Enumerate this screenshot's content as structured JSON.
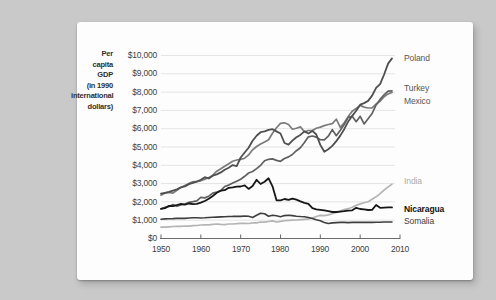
{
  "page": {
    "background": "#c9c9c9",
    "card_background": "#fdfdfd"
  },
  "axis_title_lines": [
    "Per",
    "capita",
    "GDP",
    "(in 1990",
    "international",
    "dollars)"
  ],
  "chart_data": {
    "type": "line",
    "title": "Per capita GDP (in 1990 international dollars)",
    "ylabel": "Per capita GDP (in 1990 international dollars)",
    "xlabel": "",
    "x_range": [
      1950,
      2010
    ],
    "y_range": [
      0,
      10000
    ],
    "grid": "horizontal",
    "grid_color": "#e4e4e4",
    "axis_color": "#6b6b6b",
    "y_ticks": [
      "$10,000",
      "$9,000",
      "$8,000",
      "$7,000",
      "$6,000",
      "$5,000",
      "$4,000",
      "$3,000",
      "$2,000",
      "$1,000",
      "$0"
    ],
    "x_ticks": [
      "1950",
      "1960",
      "1970",
      "1980",
      "1990",
      "2000",
      "2010"
    ],
    "years_start": 1950,
    "years_end": 2008,
    "legend_position": "right-of-line-endpoints",
    "series": [
      {
        "name": "Poland",
        "color": "#4f4f4f",
        "width": 1.8,
        "z": 3,
        "label_color": "#555555",
        "label_bold": false,
        "values": [
          2447,
          2496,
          2545,
          2618,
          2683,
          2790,
          2846,
          2970,
          3045,
          3105,
          3215,
          3350,
          3280,
          3430,
          3500,
          3612,
          3760,
          3870,
          4010,
          3950,
          4428,
          4700,
          4963,
          5340,
          5620,
          5810,
          5850,
          5942,
          5975,
          5850,
          5740,
          5220,
          5130,
          5350,
          5530,
          5660,
          5850,
          5740,
          5880,
          5684,
          5113,
          4738,
          4880,
          5060,
          5320,
          5623,
          5970,
          6390,
          6700,
          6980,
          7309,
          7400,
          7520,
          7810,
          8230,
          8436,
          8960,
          9560,
          9840
        ]
      },
      {
        "name": "Turkey",
        "color": "#606060",
        "width": 1.7,
        "z": 2,
        "label_color": "#555555",
        "label_bold": false,
        "values": [
          1623,
          1700,
          1750,
          1850,
          1760,
          1830,
          1880,
          1970,
          2010,
          2060,
          2247,
          2220,
          2310,
          2480,
          2540,
          2620,
          2840,
          2920,
          3030,
          3130,
          3240,
          3400,
          3580,
          3660,
          3820,
          4000,
          4250,
          4330,
          4350,
          4270,
          4220,
          4370,
          4460,
          4590,
          4800,
          4960,
          5240,
          5560,
          5600,
          5540,
          5400,
          5390,
          5590,
          5950,
          5620,
          5920,
          6230,
          6620,
          6680,
          6380,
          6680,
          6260,
          6540,
          6830,
          7300,
          7600,
          7850,
          8050,
          8066
        ]
      },
      {
        "name": "Mexico",
        "color": "#7b7b7b",
        "width": 1.7,
        "z": 1,
        "label_color": "#555555",
        "label_bold": false,
        "values": [
          2365,
          2480,
          2520,
          2480,
          2640,
          2790,
          2900,
          3010,
          3100,
          3120,
          3155,
          3245,
          3330,
          3465,
          3680,
          3810,
          3950,
          4080,
          4220,
          4290,
          4320,
          4390,
          4570,
          4845,
          5030,
          5160,
          5270,
          5400,
          5750,
          6050,
          6290,
          6320,
          6230,
          5970,
          6030,
          6100,
          5830,
          5900,
          5899,
          6030,
          6085,
          6170,
          6231,
          6280,
          6519,
          6072,
          6330,
          6660,
          6950,
          7110,
          7275,
          7180,
          7130,
          7137,
          7350,
          7500,
          7750,
          7900,
          7979
        ]
      },
      {
        "name": "India",
        "color": "#b4b4b4",
        "width": 1.7,
        "z": 4,
        "label_color": "#ababab",
        "label_bold": false,
        "values": [
          619,
          625,
          640,
          655,
          660,
          665,
          685,
          680,
          700,
          710,
          735,
          745,
          750,
          770,
          790,
          770,
          760,
          790,
          790,
          810,
          830,
          830,
          820,
          853,
          850,
          900,
          890,
          930,
          960,
          900,
          938,
          970,
          990,
          1000,
          1010,
          1030,
          1050,
          1070,
          1120,
          1200,
          1260,
          1250,
          1290,
          1350,
          1420,
          1500,
          1580,
          1630,
          1710,
          1810,
          1892,
          1950,
          2010,
          2140,
          2280,
          2450,
          2640,
          2820,
          2975
        ]
      },
      {
        "name": "Nicaragua",
        "color": "#161616",
        "width": 1.8,
        "z": 6,
        "label_color": "#111111",
        "label_bold": true,
        "values": [
          1616,
          1660,
          1780,
          1770,
          1830,
          1890,
          1850,
          1910,
          1880,
          1890,
          1960,
          2050,
          2170,
          2320,
          2500,
          2610,
          2640,
          2770,
          2790,
          2830,
          2840,
          2900,
          2710,
          2870,
          3210,
          2980,
          3100,
          3292,
          2850,
          2090,
          2085,
          2160,
          2110,
          2180,
          2120,
          2030,
          1950,
          1890,
          1660,
          1590,
          1570,
          1540,
          1500,
          1450,
          1450,
          1470,
          1490,
          1520,
          1540,
          1680,
          1610,
          1590,
          1560,
          1570,
          1830,
          1680,
          1690,
          1700,
          1700
        ]
      },
      {
        "name": "Somalia",
        "color": "#3e3e3e",
        "width": 1.6,
        "z": 5,
        "label_color": "#3d3d3d",
        "label_bold": false,
        "values": [
          1057,
          1070,
          1080,
          1090,
          1100,
          1110,
          1100,
          1120,
          1130,
          1130,
          1120,
          1130,
          1150,
          1160,
          1170,
          1180,
          1190,
          1200,
          1210,
          1220,
          1210,
          1230,
          1220,
          1150,
          1270,
          1380,
          1350,
          1220,
          1270,
          1240,
          1190,
          1250,
          1270,
          1250,
          1220,
          1200,
          1190,
          1150,
          1090,
          1020,
          970,
          880,
          820,
          850,
          870,
          880,
          880,
          870,
          880,
          880,
          880,
          880,
          880,
          880,
          890,
          890,
          900,
          900,
          900
        ]
      }
    ]
  }
}
